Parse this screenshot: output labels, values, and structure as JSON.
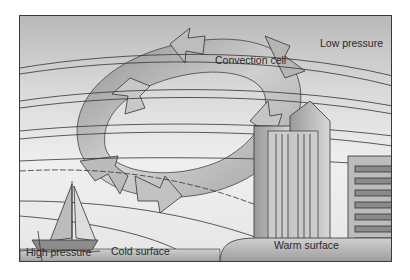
{
  "diagram": {
    "labels": {
      "low_pressure": "Low pressure",
      "convection_cell": "Convection cell",
      "high_pressure": "High pressure",
      "cold_surface": "Cold surface",
      "warm_surface": "Warm surface"
    },
    "elements": [
      "convection-cell-arrows",
      "isobar-lines",
      "sailboat",
      "city-buildings",
      "cold-surface-ground",
      "warm-surface-ground"
    ],
    "colors": {
      "frame_border": "#3a3a3a",
      "sky_top": "#b9b9b9",
      "sky_bottom": "#e6e6e6",
      "arrow_fill": "#a8a8a8",
      "ground": "#9e9e9e",
      "line": "#333333"
    }
  }
}
